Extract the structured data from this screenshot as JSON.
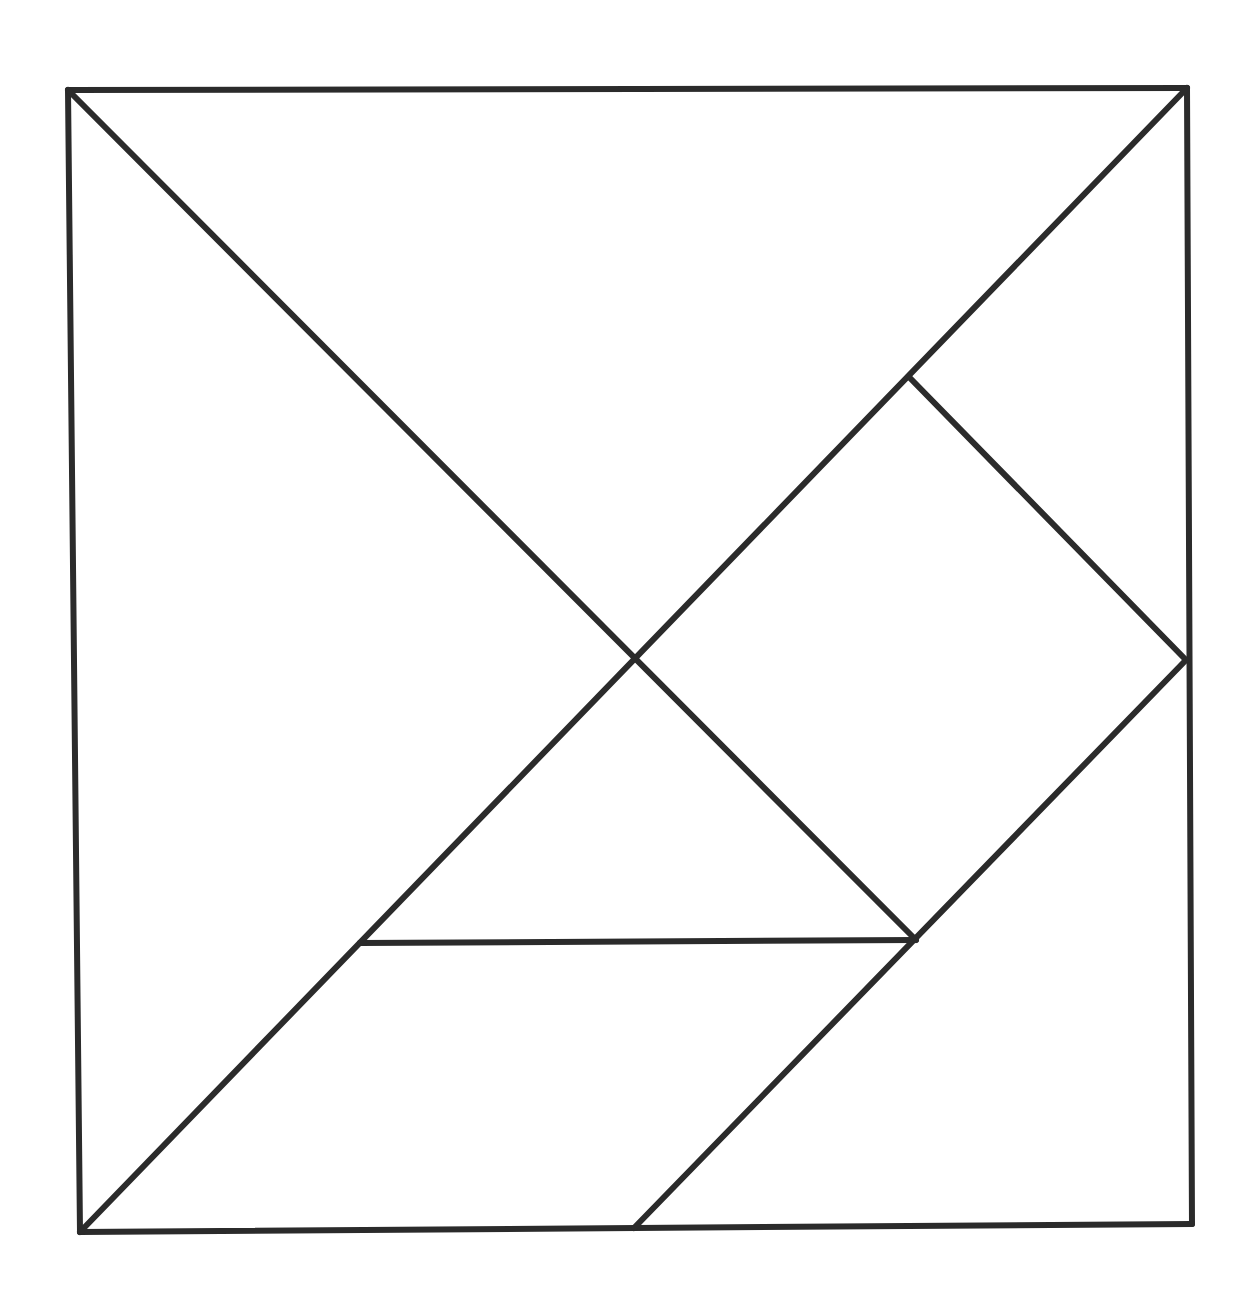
{
  "diagram": {
    "type": "tangram",
    "stroke_color": "#2b2b2b",
    "background": "#ffffff",
    "points": {
      "TL": [
        68,
        90
      ],
      "TR": [
        1187,
        88
      ],
      "BL": [
        80,
        1232
      ],
      "BR": [
        1192,
        1224
      ],
      "C": [
        638,
        657
      ],
      "SQ_TOP": [
        910,
        378
      ],
      "RM": [
        1186,
        660
      ],
      "SQ_BOT": [
        916,
        940
      ],
      "PL_TOP": [
        360,
        943
      ],
      "BM": [
        634,
        1228
      ]
    },
    "pieces": [
      {
        "name": "large-triangle-top",
        "vertices": [
          "TL",
          "TR",
          "C"
        ]
      },
      {
        "name": "large-triangle-left",
        "vertices": [
          "TL",
          "C",
          "BL"
        ]
      },
      {
        "name": "small-triangle-top-right",
        "vertices": [
          "TR",
          "RM",
          "SQ_TOP"
        ]
      },
      {
        "name": "square",
        "vertices": [
          "SQ_TOP",
          "RM",
          "SQ_BOT",
          "C"
        ]
      },
      {
        "name": "small-triangle-center",
        "vertices": [
          "C",
          "SQ_BOT",
          "PL_TOP"
        ]
      },
      {
        "name": "parallelogram",
        "vertices": [
          "PL_TOP",
          "SQ_BOT",
          "BM",
          "BL"
        ]
      },
      {
        "name": "medium-triangle-bottom-right",
        "vertices": [
          "RM",
          "BR",
          "BM"
        ]
      }
    ],
    "edges": [
      [
        "TL",
        "TR"
      ],
      [
        "TR",
        "BR"
      ],
      [
        "BR",
        "BL"
      ],
      [
        "BL",
        "TL"
      ],
      [
        "TL",
        "SQ_BOT"
      ],
      [
        "BL",
        "TR"
      ],
      [
        "SQ_TOP",
        "RM"
      ],
      [
        "RM",
        "BM"
      ],
      [
        "PL_TOP",
        "SQ_BOT"
      ]
    ]
  }
}
